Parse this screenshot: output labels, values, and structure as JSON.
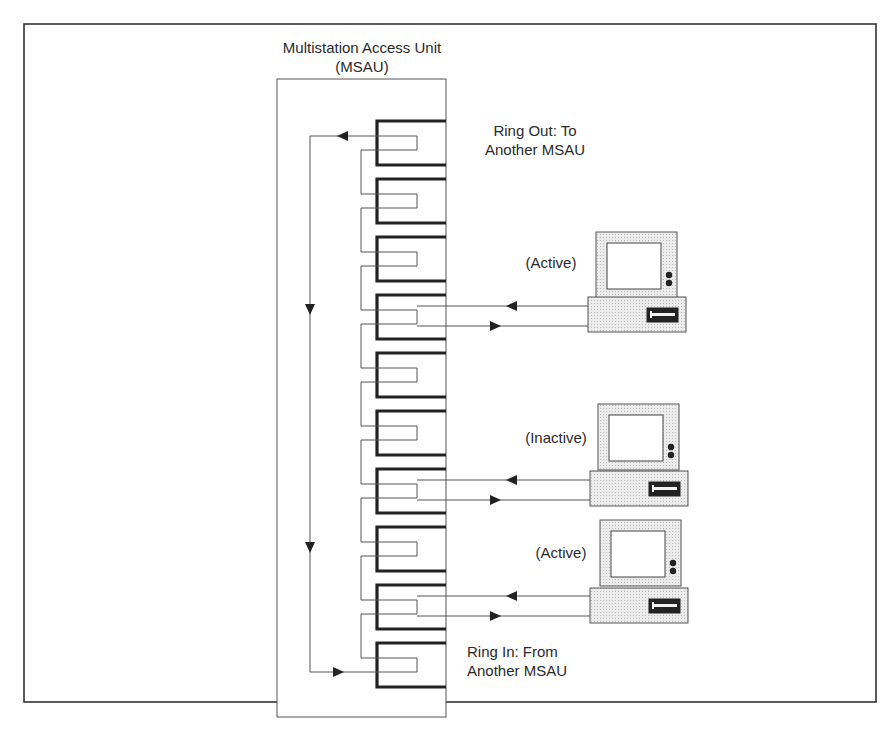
{
  "diagram": {
    "title_line1": "Multistation Access Unit",
    "title_line2": "(MSAU)",
    "ring_out_line1": "Ring Out: To",
    "ring_out_line2": "Another MSAU",
    "ring_in_line1": "Ring In: From",
    "ring_in_line2": "Another MSAU",
    "port_count": 10,
    "stations": [
      {
        "label": "(Active)",
        "port": 4,
        "status": "active"
      },
      {
        "label": "(Inactive)",
        "port": 7,
        "status": "inactive"
      },
      {
        "label": "(Active)",
        "port": 9,
        "status": "active"
      }
    ],
    "colors": {
      "line": "#555555",
      "port_bracket": "#222222",
      "computer_fill": "#e4e4e4",
      "screen_fill": "#ffffff"
    }
  }
}
